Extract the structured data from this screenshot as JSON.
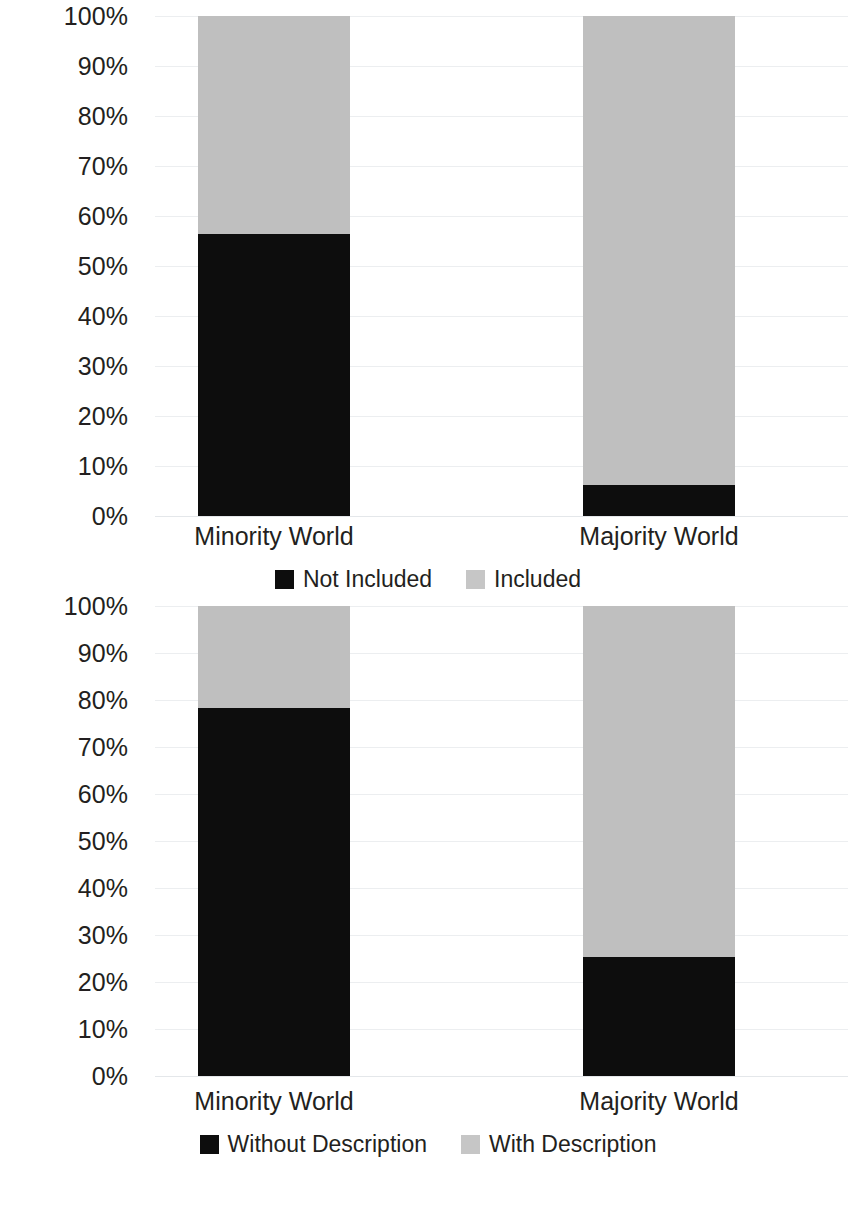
{
  "colors": {
    "dark": "#0d0d0d",
    "light": "#bfbfbf",
    "legend_light": "#c6c6c6",
    "gridline": "#eceef0",
    "text": "#231f20",
    "background": "#ffffff"
  },
  "axis": {
    "yticks": [
      "100%",
      "90%",
      "80%",
      "70%",
      "60%",
      "50%",
      "40%",
      "30%",
      "20%",
      "10%",
      "0%"
    ],
    "ymin": 0,
    "ymax": 100,
    "ystep": 10
  },
  "charts": [
    {
      "id": "inclusion-chart",
      "categories": [
        "Minority World",
        "Majority World"
      ],
      "legend": [
        {
          "label": "Not Included",
          "swatch": "dark"
        },
        {
          "label": "Included",
          "swatch": "light"
        }
      ],
      "bars": [
        {
          "category": "Minority World",
          "dark": 56.5,
          "light": 43.5
        },
        {
          "category": "Majority World",
          "dark": 6.3,
          "light": 93.7
        }
      ]
    },
    {
      "id": "description-chart",
      "categories": [
        "Minority World",
        "Majority World"
      ],
      "legend": [
        {
          "label": "Without Description",
          "swatch": "dark"
        },
        {
          "label": "With Description",
          "swatch": "light"
        }
      ],
      "bars": [
        {
          "category": "Minority World",
          "dark": 78.3,
          "light": 21.7
        },
        {
          "category": "Majority World",
          "dark": 25.3,
          "light": 74.7
        }
      ]
    }
  ],
  "chart_data": [
    {
      "type": "bar",
      "subtype": "stacked-100-percent",
      "title": "",
      "xlabel": "",
      "ylabel": "",
      "ylim": [
        0,
        100
      ],
      "ytick_labels": [
        "0%",
        "10%",
        "20%",
        "30%",
        "40%",
        "50%",
        "60%",
        "70%",
        "80%",
        "90%",
        "100%"
      ],
      "grid": true,
      "legend_position": "bottom-center",
      "categories": [
        "Minority World",
        "Majority World"
      ],
      "series": [
        {
          "name": "Not Included",
          "color": "#0d0d0d",
          "values": [
            56.5,
            6.3
          ]
        },
        {
          "name": "Included",
          "color": "#bfbfbf",
          "values": [
            43.5,
            93.7
          ]
        }
      ]
    },
    {
      "type": "bar",
      "subtype": "stacked-100-percent",
      "title": "",
      "xlabel": "",
      "ylabel": "",
      "ylim": [
        0,
        100
      ],
      "ytick_labels": [
        "0%",
        "10%",
        "20%",
        "30%",
        "40%",
        "50%",
        "60%",
        "70%",
        "80%",
        "90%",
        "100%"
      ],
      "grid": true,
      "legend_position": "bottom-center",
      "categories": [
        "Minority World",
        "Majority World"
      ],
      "series": [
        {
          "name": "Without Description",
          "color": "#0d0d0d",
          "values": [
            78.3,
            25.3
          ]
        },
        {
          "name": "With Description",
          "color": "#bfbfbf",
          "values": [
            21.7,
            74.7
          ]
        }
      ]
    }
  ]
}
